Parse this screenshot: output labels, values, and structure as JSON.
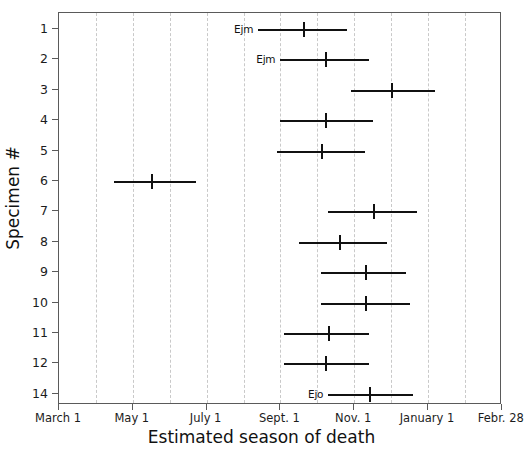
{
  "chart_data": {
    "type": "bar",
    "subtype": "interval-range-with-median",
    "title": "",
    "xlabel": "Estimated season of death",
    "ylabel": "Specimen #",
    "grid": true,
    "legend": "none",
    "xlim": [
      "March 1",
      "Febr. 28"
    ],
    "x_tick_labels": [
      "March 1",
      "May 1",
      "July 1",
      "Sept. 1",
      "Nov. 1",
      "January 1",
      "Febr. 28"
    ],
    "x_tick_months": [
      0,
      2,
      4,
      6,
      8,
      10,
      12
    ],
    "x_minor_gridline_months": [
      1,
      2,
      3,
      4,
      5,
      6,
      7,
      8,
      9,
      10,
      11
    ],
    "categories": [
      "1",
      "2",
      "3",
      "4",
      "5",
      "6",
      "7",
      "8",
      "9",
      "10",
      "11",
      "12",
      "14"
    ],
    "series": [
      {
        "name": "Estimated season of death interval",
        "units": "months after March 1",
        "points": [
          {
            "specimen": "1",
            "label": "Ejm",
            "low": 5.4,
            "median": 6.6,
            "high": 7.8
          },
          {
            "specimen": "2",
            "label": "Ejm",
            "low": 6.0,
            "median": 7.2,
            "high": 8.4
          },
          {
            "specimen": "3",
            "label": "",
            "low": 7.9,
            "median": 9.0,
            "high": 10.2
          },
          {
            "specimen": "4",
            "label": "",
            "low": 6.0,
            "median": 7.2,
            "high": 8.5
          },
          {
            "specimen": "5",
            "label": "",
            "low": 5.9,
            "median": 7.1,
            "high": 8.3
          },
          {
            "specimen": "6",
            "label": "",
            "low": 1.5,
            "median": 2.5,
            "high": 3.7
          },
          {
            "specimen": "7",
            "label": "",
            "low": 7.3,
            "median": 8.5,
            "high": 9.7
          },
          {
            "specimen": "8",
            "label": "",
            "low": 6.5,
            "median": 7.6,
            "high": 8.9
          },
          {
            "specimen": "9",
            "label": "",
            "low": 7.1,
            "median": 8.3,
            "high": 9.4
          },
          {
            "specimen": "10",
            "label": "",
            "low": 7.1,
            "median": 8.3,
            "high": 9.5
          },
          {
            "specimen": "11",
            "label": "",
            "low": 6.1,
            "median": 7.3,
            "high": 8.4
          },
          {
            "specimen": "12",
            "label": "",
            "low": 6.1,
            "median": 7.2,
            "high": 8.4
          },
          {
            "specimen": "14",
            "label": "Ejo",
            "low": 7.3,
            "median": 8.4,
            "high": 9.6
          }
        ]
      }
    ],
    "colors": {
      "interval": "#111111",
      "median": "#111111",
      "gridline": "#c9c9c9",
      "frame": "#5a5a5a",
      "background": "#ffffff"
    }
  }
}
